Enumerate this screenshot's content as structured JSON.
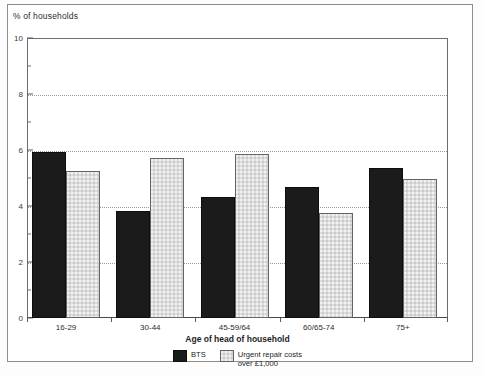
{
  "chart_data": {
    "type": "bar",
    "title": "",
    "subtitle": "",
    "ylabel": "% of households",
    "xlabel": "Age of head of household",
    "ylim": [
      0,
      10
    ],
    "ytick_step": 2,
    "yticks": [
      "0",
      "2",
      "4",
      "6",
      "8",
      "10"
    ],
    "minor_yticks": [
      1,
      3,
      5,
      7,
      9
    ],
    "grid": "horizontal-dotted",
    "gridlines_at": [
      2,
      4,
      6,
      8
    ],
    "legend_position": "bottom-center",
    "categories": [
      "16-29",
      "30-44",
      "45-59/64",
      "60/65-74",
      "75+"
    ],
    "series": [
      {
        "name": "BTS",
        "color": "#1b1b1b",
        "values": [
          5.95,
          3.85,
          4.35,
          4.7,
          5.4
        ]
      },
      {
        "name": "Urgent repair costs over £1,000",
        "color": "#dcdcdc",
        "values": [
          5.3,
          5.75,
          5.9,
          3.8,
          5.0
        ]
      }
    ]
  },
  "legend": {
    "entries": [
      {
        "label": "BTS",
        "swatch": "black-solid"
      },
      {
        "label": "Urgent repair costs\nover £1,000",
        "swatch": "gray-stipple"
      }
    ]
  },
  "colors": {
    "series_bts": "#1b1b1b",
    "series_urgent": "#dcdcdc",
    "axis": "#5a5a5a",
    "grid": "#9a9a9a",
    "frame": "#8d8d8d",
    "background": "#ffffff"
  }
}
